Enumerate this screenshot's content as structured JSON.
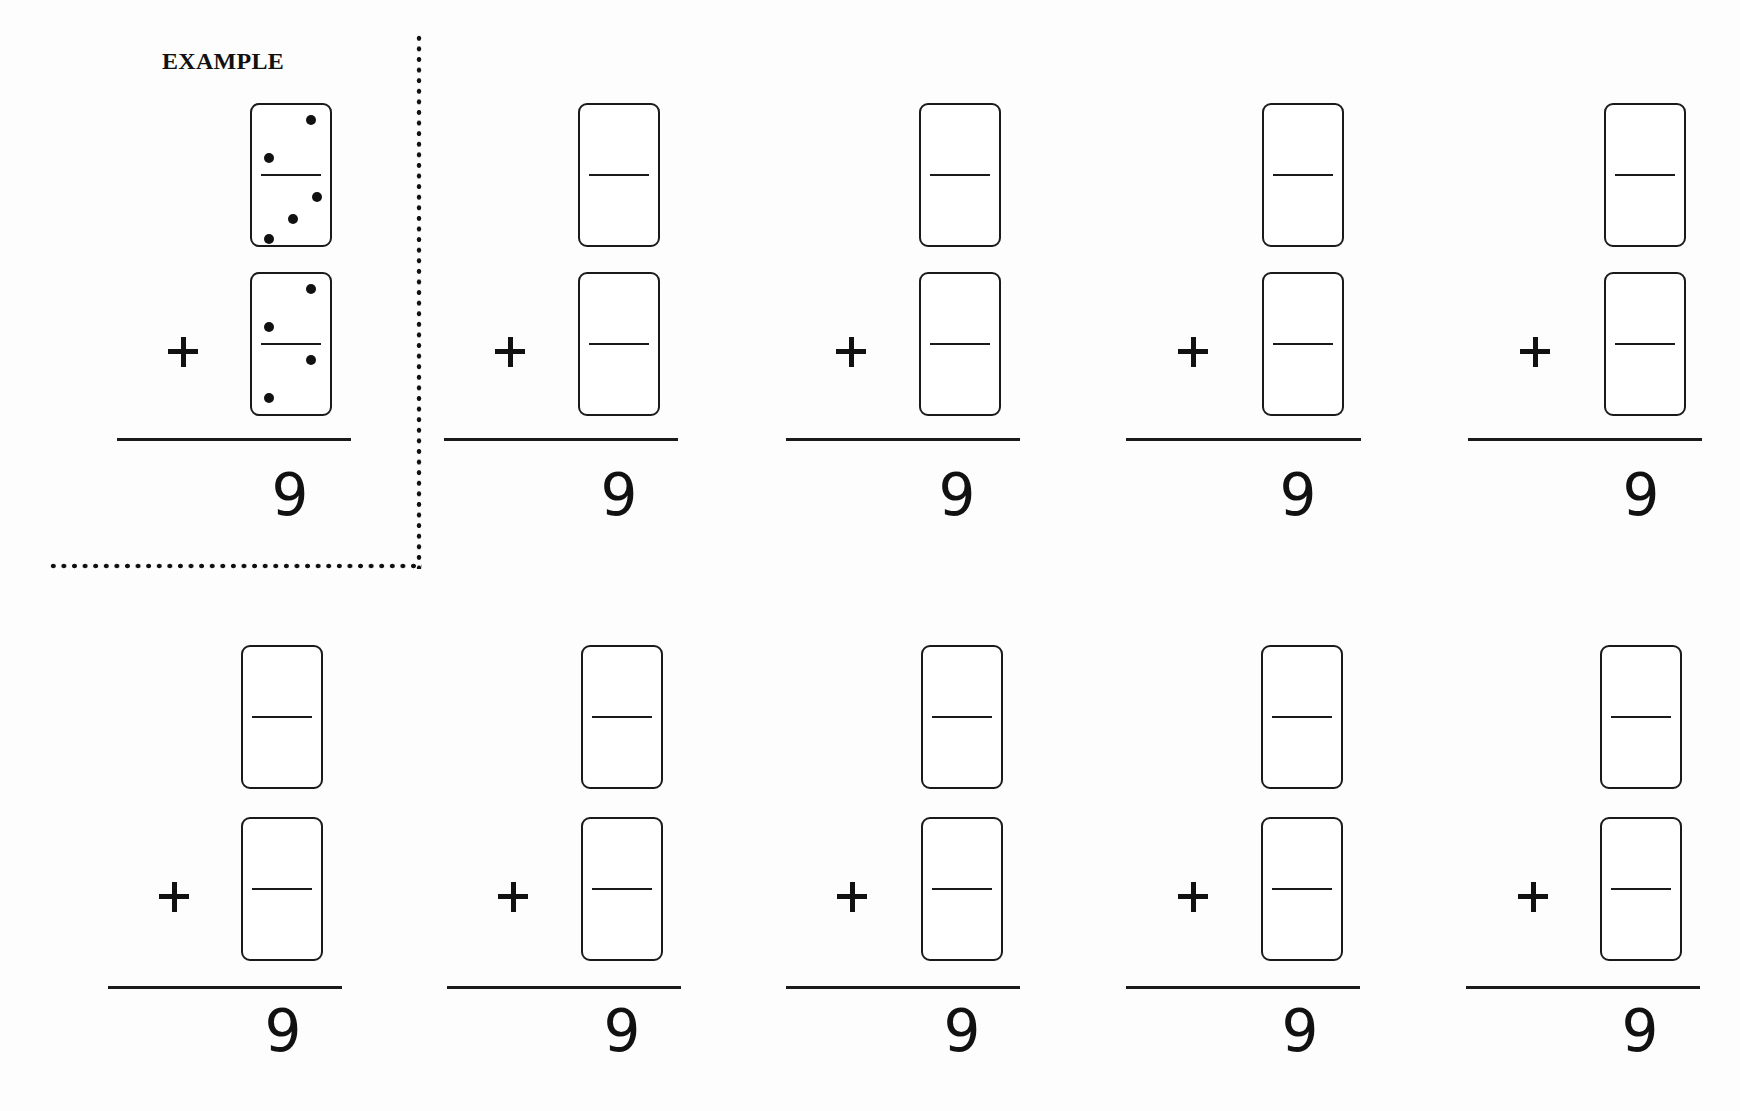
{
  "worksheet": {
    "example_label": "EXAMPLE",
    "operator_symbol": "+",
    "operator_icon": "plus-icon",
    "example": {
      "top_domino": {
        "top_pips": 2,
        "bottom_pips": 3
      },
      "bottom_domino": {
        "top_pips": 2,
        "bottom_pips": 2
      },
      "sum": "9"
    },
    "problems": [
      {
        "sum": "9",
        "top_domino": {
          "top_pips": null,
          "bottom_pips": null
        },
        "bottom_domino": {
          "top_pips": null,
          "bottom_pips": null
        }
      },
      {
        "sum": "9",
        "top_domino": {
          "top_pips": null,
          "bottom_pips": null
        },
        "bottom_domino": {
          "top_pips": null,
          "bottom_pips": null
        }
      },
      {
        "sum": "9",
        "top_domino": {
          "top_pips": null,
          "bottom_pips": null
        },
        "bottom_domino": {
          "top_pips": null,
          "bottom_pips": null
        }
      },
      {
        "sum": "9",
        "top_domino": {
          "top_pips": null,
          "bottom_pips": null
        },
        "bottom_domino": {
          "top_pips": null,
          "bottom_pips": null
        }
      },
      {
        "sum": "9",
        "top_domino": {
          "top_pips": null,
          "bottom_pips": null
        },
        "bottom_domino": {
          "top_pips": null,
          "bottom_pips": null
        }
      },
      {
        "sum": "9",
        "top_domino": {
          "top_pips": null,
          "bottom_pips": null
        },
        "bottom_domino": {
          "top_pips": null,
          "bottom_pips": null
        }
      },
      {
        "sum": "9",
        "top_domino": {
          "top_pips": null,
          "bottom_pips": null
        },
        "bottom_domino": {
          "top_pips": null,
          "bottom_pips": null
        }
      },
      {
        "sum": "9",
        "top_domino": {
          "top_pips": null,
          "bottom_pips": null
        },
        "bottom_domino": {
          "top_pips": null,
          "bottom_pips": null
        }
      },
      {
        "sum": "9",
        "top_domino": {
          "top_pips": null,
          "bottom_pips": null
        },
        "bottom_domino": {
          "top_pips": null,
          "bottom_pips": null
        }
      }
    ]
  }
}
